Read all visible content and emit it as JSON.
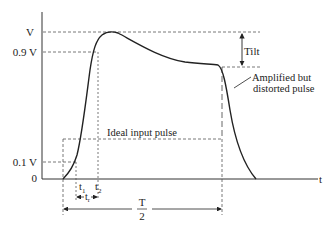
{
  "diagram": {
    "y_labels": {
      "peak": "V",
      "ninety": "0.9 V",
      "ten": "0.1 V",
      "zero": "0"
    },
    "x_label": "t",
    "t1_label": "t",
    "t1_sub": "1",
    "t2_label": "t",
    "t2_sub": "2",
    "tr_label": "t",
    "tr_sub": "r",
    "half_period_num": "T",
    "half_period_den": "2",
    "tilt_label": "Tilt",
    "ideal_label": "Ideal input pulse",
    "distorted_label_line1": "Amplified but",
    "distorted_label_line2": "distorted pulse",
    "colors": {
      "curve": "#222222",
      "dashed": "#555555",
      "axis": "#333333"
    }
  }
}
